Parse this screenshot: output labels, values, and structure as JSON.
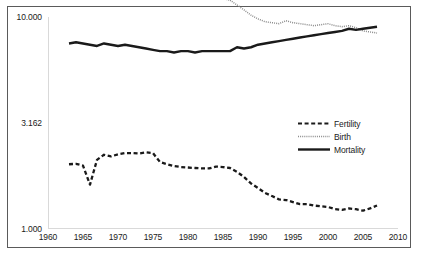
{
  "chart_data": {
    "type": "line",
    "title": "",
    "subtitle": "",
    "xlabel": "",
    "ylabel": "",
    "xlim": [
      1960,
      2010
    ],
    "ylim": [
      1.0,
      10.0
    ],
    "yscale": "log",
    "grid": false,
    "legend_position": "center-right",
    "x_tick_labels": [
      "1960",
      "1965",
      "1970",
      "1975",
      "1980",
      "1985",
      "1990",
      "1995",
      "2000",
      "2005",
      "2010"
    ],
    "x_ticks": [
      1960,
      1965,
      1970,
      1975,
      1980,
      1985,
      1990,
      1995,
      2000,
      2005,
      2010
    ],
    "y_tick_labels": [
      "10.000",
      "3.162",
      "1.000"
    ],
    "y_ticks": [
      10.0,
      3.162,
      1.0
    ],
    "x": [
      1963,
      1964,
      1965,
      1966,
      1967,
      1968,
      1969,
      1970,
      1971,
      1972,
      1973,
      1974,
      1975,
      1976,
      1977,
      1978,
      1979,
      1980,
      1981,
      1982,
      1983,
      1984,
      1985,
      1986,
      1987,
      1988,
      1989,
      1990,
      1991,
      1992,
      1993,
      1994,
      1995,
      1996,
      1997,
      1998,
      1999,
      2000,
      2001,
      2002,
      2003,
      2004,
      2005,
      2006,
      2007
    ],
    "series": [
      {
        "name": "Fertility",
        "style": "dashed",
        "color": "#1a1a1a",
        "values": [
          2.02,
          2.03,
          1.99,
          1.62,
          2.12,
          2.24,
          2.2,
          2.25,
          2.28,
          2.28,
          2.27,
          2.3,
          2.28,
          2.07,
          2.02,
          1.98,
          1.96,
          1.95,
          1.94,
          1.93,
          1.93,
          1.97,
          1.96,
          1.94,
          1.86,
          1.76,
          1.64,
          1.56,
          1.48,
          1.43,
          1.38,
          1.37,
          1.34,
          1.31,
          1.31,
          1.29,
          1.28,
          1.27,
          1.24,
          1.23,
          1.25,
          1.24,
          1.22,
          1.25,
          1.29
        ]
      },
      {
        "name": "Birth",
        "style": "dotted",
        "color": "#8c8c8c",
        "values": [
          15.2,
          15.7,
          14.6,
          12.8,
          16.3,
          16.2,
          15.9,
          16.2,
          16.5,
          16.5,
          16.6,
          16.7,
          16.6,
          15.5,
          14.9,
          14.3,
          13.9,
          13.5,
          13.0,
          12.7,
          12.4,
          12.3,
          12.2,
          12.0,
          11.4,
          10.8,
          10.2,
          9.8,
          9.5,
          9.4,
          9.3,
          9.6,
          9.4,
          9.3,
          9.2,
          9.1,
          9.2,
          9.3,
          9.1,
          9.0,
          9.1,
          8.9,
          8.6,
          8.5,
          8.4
        ]
      },
      {
        "name": "Mortality",
        "style": "solid",
        "color": "#1a1a1a",
        "values": [
          7.5,
          7.6,
          7.5,
          7.4,
          7.3,
          7.5,
          7.4,
          7.3,
          7.4,
          7.3,
          7.2,
          7.1,
          7.0,
          6.9,
          6.9,
          6.8,
          6.9,
          6.9,
          6.8,
          6.9,
          6.9,
          6.9,
          6.9,
          6.9,
          7.2,
          7.1,
          7.2,
          7.4,
          7.5,
          7.6,
          7.7,
          7.8,
          7.9,
          8.0,
          8.1,
          8.2,
          8.3,
          8.4,
          8.5,
          8.6,
          8.8,
          8.7,
          8.8,
          8.9,
          9.0
        ]
      }
    ]
  },
  "legend": {
    "items": [
      {
        "label": "Fertility"
      },
      {
        "label": "Birth"
      },
      {
        "label": "Mortality"
      }
    ]
  }
}
